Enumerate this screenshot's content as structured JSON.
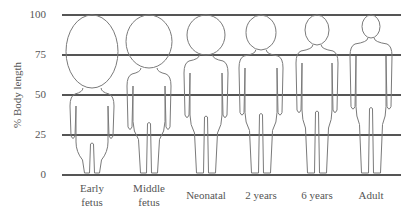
{
  "chart_data": {
    "type": "diagram",
    "title": "",
    "ylabel": "% Body length",
    "xlabel": "",
    "ylim": [
      0,
      100
    ],
    "yticks": [
      0,
      25,
      50,
      75,
      100
    ],
    "grid": true,
    "categories": [
      "Early fetus",
      "Middle fetus",
      "Neonatal",
      "2 years",
      "6 years",
      "Adult"
    ],
    "series": [
      {
        "name": "Head height (% body length)",
        "values": [
          50,
          33,
          25,
          20,
          17,
          13
        ]
      }
    ]
  },
  "y_axis": {
    "label": "% Body length",
    "ticks": [
      "100",
      "75",
      "50",
      "25",
      "0"
    ]
  },
  "figures": [
    {
      "label_lines": [
        "Early",
        "fetus"
      ],
      "cx": 92,
      "head_bottom": 88,
      "head_w": 52,
      "body_w": 44,
      "stage": "early-fetus"
    },
    {
      "label_lines": [
        "Middle",
        "fetus"
      ],
      "cx": 149,
      "head_bottom": 68,
      "head_w": 46,
      "body_w": 44,
      "stage": "middle-fetus"
    },
    {
      "label_lines": [
        "Neonatal"
      ],
      "cx": 206,
      "head_bottom": 55,
      "head_w": 38,
      "body_w": 44,
      "stage": "neonatal"
    },
    {
      "label_lines": [
        "2 years"
      ],
      "cx": 261,
      "head_bottom": 50,
      "head_w": 30,
      "body_w": 44,
      "stage": "2-years"
    },
    {
      "label_lines": [
        "6 years"
      ],
      "cx": 317,
      "head_bottom": 45,
      "head_w": 24,
      "body_w": 42,
      "stage": "6-years"
    },
    {
      "label_lines": [
        "Adult"
      ],
      "cx": 371,
      "head_bottom": 38,
      "head_w": 18,
      "body_w": 42,
      "stage": "adult"
    }
  ],
  "colors": {
    "gridline": "#555555",
    "outline": "#7a7a7a",
    "text": "#555555",
    "background": "#ffffff"
  }
}
